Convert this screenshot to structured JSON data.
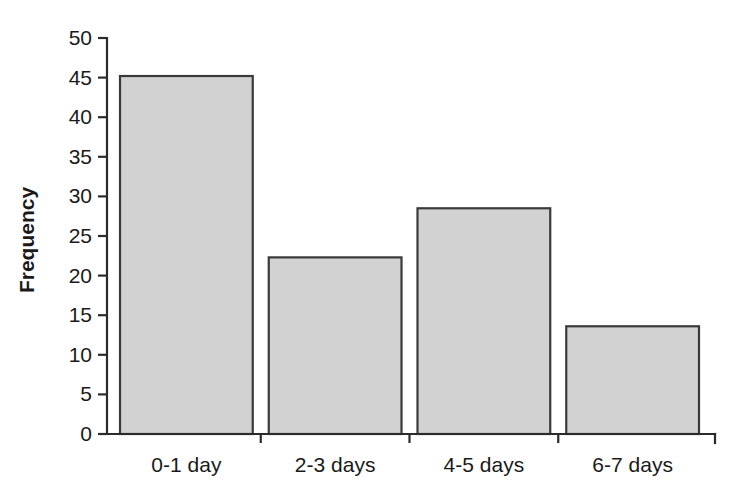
{
  "chart_data": {
    "type": "bar",
    "title": "",
    "subtitle": "",
    "xlabel": "",
    "ylabel": "Frequency",
    "categories": [
      "0-1 day",
      "2-3 days",
      "4-5 days",
      "6-7 days"
    ],
    "values": [
      45.2,
      22.3,
      28.5,
      13.6
    ],
    "series": [
      {
        "name": "Frequency",
        "values": [
          45.2,
          22.3,
          28.5,
          13.6
        ]
      }
    ],
    "ylim": [
      0,
      50
    ],
    "ytick_labels": [
      "0",
      "5",
      "10",
      "15",
      "20",
      "25",
      "30",
      "35",
      "40",
      "45",
      "50"
    ],
    "ytick_values": [
      0,
      5,
      10,
      15,
      20,
      25,
      30,
      35,
      40,
      45,
      50
    ],
    "ytick_step": 5,
    "grid": false,
    "legend": false,
    "legend_position": "none",
    "bar_fill_color": "#d2d2d2",
    "bar_edge_color": "#3a3a3a",
    "axis_color": "#2b2b2b",
    "background_color": "#ffffff"
  },
  "layout": {
    "plot_left": 107,
    "plot_right": 715,
    "plot_bottom": 434,
    "plot_top": 38,
    "bar_gap_px": 16,
    "ylabel_x": 34,
    "ylabel_y": 240,
    "category_label_y": 472,
    "tick_label_x": 92,
    "tick_len": 9
  }
}
